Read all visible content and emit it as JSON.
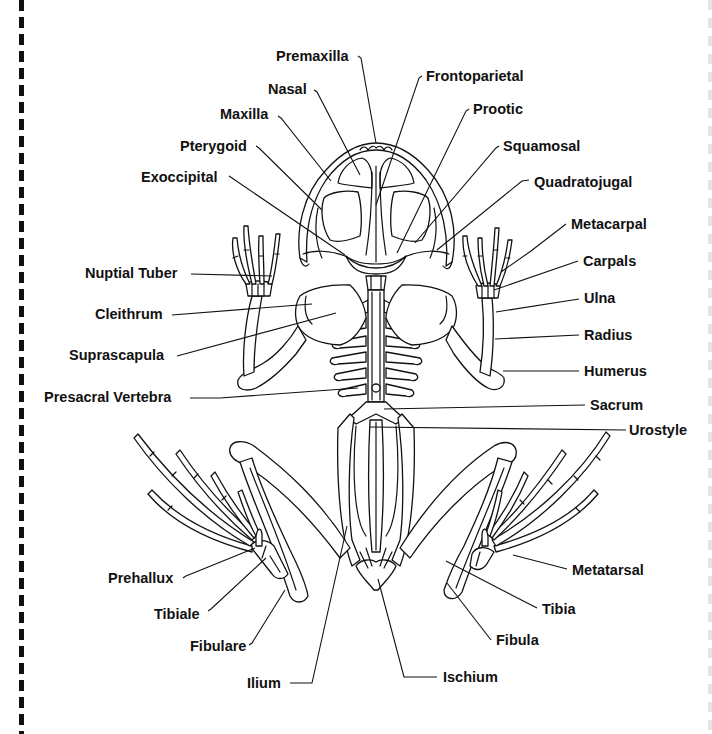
{
  "diagram": {
    "labels": [
      {
        "id": "premaxilla",
        "text": "Premaxilla",
        "x": 276,
        "y": 61,
        "anchor": "start",
        "line": [
          [
            358,
            56
          ],
          [
            361,
            58
          ],
          [
            376,
            143
          ]
        ]
      },
      {
        "id": "nasal",
        "text": "Nasal",
        "x": 268,
        "y": 94,
        "anchor": "start",
        "line": [
          [
            314,
            90
          ],
          [
            317,
            92
          ],
          [
            360,
            175
          ]
        ]
      },
      {
        "id": "maxilla",
        "text": "Maxilla",
        "x": 220,
        "y": 119,
        "anchor": "start",
        "line": [
          [
            278,
            116
          ],
          [
            281,
            118
          ],
          [
            331,
            181
          ]
        ]
      },
      {
        "id": "pterygoid",
        "text": "Pterygoid",
        "x": 180,
        "y": 151,
        "anchor": "start",
        "line": [
          [
            256,
            146
          ],
          [
            259,
            148
          ],
          [
            322,
            210
          ]
        ]
      },
      {
        "id": "exoccipital",
        "text": "Exoccipital",
        "x": 141,
        "y": 182,
        "anchor": "start",
        "line": [
          [
            229,
            176
          ],
          [
            232,
            178
          ],
          [
            345,
            255
          ]
        ]
      },
      {
        "id": "frontoparietal",
        "text": "Frontoparietal",
        "x": 426,
        "y": 81,
        "anchor": "start",
        "line": [
          [
            422,
            76
          ],
          [
            419,
            78
          ],
          [
            376,
            205
          ]
        ]
      },
      {
        "id": "prootic",
        "text": "Prootic",
        "x": 473,
        "y": 114,
        "anchor": "start",
        "line": [
          [
            469,
            109
          ],
          [
            466,
            111
          ],
          [
            397,
            253
          ]
        ]
      },
      {
        "id": "squamosal",
        "text": "Squamosal",
        "x": 503,
        "y": 151,
        "anchor": "start",
        "line": [
          [
            499,
            146
          ],
          [
            496,
            148
          ],
          [
            415,
            243
          ]
        ]
      },
      {
        "id": "quadratojugal",
        "text": "Quadratojugal",
        "x": 534,
        "y": 187,
        "anchor": "start",
        "line": [
          [
            529,
            180
          ],
          [
            522,
            181
          ],
          [
            437,
            250
          ]
        ]
      },
      {
        "id": "metacarpal",
        "text": "Metacarpal",
        "x": 571,
        "y": 229,
        "anchor": "start",
        "line": [
          [
            566,
            224
          ],
          [
            531,
            251
          ],
          [
            501,
            272
          ]
        ]
      },
      {
        "id": "nuptial-tuber",
        "text": "Nuptial Tuber",
        "x": 85,
        "y": 278,
        "anchor": "start",
        "line": [
          [
            191,
            274
          ],
          [
            272,
            276
          ]
        ]
      },
      {
        "id": "carpals",
        "text": "Carpals",
        "x": 583,
        "y": 266,
        "anchor": "start",
        "line": [
          [
            578,
            261
          ],
          [
            494,
            290
          ]
        ]
      },
      {
        "id": "cleithrum",
        "text": "Cleithrum",
        "x": 95,
        "y": 319,
        "anchor": "start",
        "line": [
          [
            172,
            315
          ],
          [
            312,
            304
          ]
        ]
      },
      {
        "id": "ulna",
        "text": "Ulna",
        "x": 584,
        "y": 303,
        "anchor": "start",
        "line": [
          [
            579,
            299
          ],
          [
            496,
            312
          ]
        ]
      },
      {
        "id": "radius",
        "text": "Radius",
        "x": 584,
        "y": 340,
        "anchor": "start",
        "line": [
          [
            579,
            335
          ],
          [
            495,
            339
          ]
        ]
      },
      {
        "id": "suprascapula",
        "text": "Suprascapula",
        "x": 69,
        "y": 360,
        "anchor": "start",
        "line": [
          [
            177,
            356
          ],
          [
            336,
            313
          ]
        ]
      },
      {
        "id": "humerus",
        "text": "Humerus",
        "x": 584,
        "y": 376,
        "anchor": "start",
        "line": [
          [
            579,
            371
          ],
          [
            503,
            371
          ]
        ]
      },
      {
        "id": "presacral-vertebra",
        "text": "Presacral Vertebra",
        "x": 44,
        "y": 402,
        "anchor": "start",
        "line": [
          [
            190,
            398
          ],
          [
            220,
            398
          ],
          [
            358,
            388
          ]
        ]
      },
      {
        "id": "sacrum",
        "text": "Sacrum",
        "x": 590,
        "y": 410,
        "anchor": "start",
        "line": [
          [
            585,
            405
          ],
          [
            384,
            409
          ]
        ]
      },
      {
        "id": "urostyle",
        "text": "Urostyle",
        "x": 629,
        "y": 435,
        "anchor": "start",
        "line": [
          [
            626,
            430
          ],
          [
            370,
            427
          ]
        ]
      },
      {
        "id": "metatarsal",
        "text": "Metatarsal",
        "x": 572,
        "y": 575,
        "anchor": "start",
        "line": [
          [
            567,
            569
          ],
          [
            513,
            555
          ]
        ]
      },
      {
        "id": "prehallux",
        "text": "Prehallux",
        "x": 108,
        "y": 583,
        "anchor": "start",
        "line": [
          [
            183,
            578
          ],
          [
            186,
            576
          ],
          [
            255,
            548
          ]
        ]
      },
      {
        "id": "tibia",
        "text": "Tibia",
        "x": 542,
        "y": 614,
        "anchor": "start",
        "line": [
          [
            537,
            608
          ],
          [
            446,
            561
          ]
        ]
      },
      {
        "id": "tibiale",
        "text": "Tibiale",
        "x": 154,
        "y": 619,
        "anchor": "start",
        "line": [
          [
            208,
            611
          ],
          [
            211,
            609
          ],
          [
            266,
            558
          ]
        ]
      },
      {
        "id": "fibula",
        "text": "Fibula",
        "x": 496,
        "y": 645,
        "anchor": "start",
        "line": [
          [
            491,
            640
          ],
          [
            447,
            583
          ]
        ]
      },
      {
        "id": "fibulare",
        "text": "Fibulare",
        "x": 190,
        "y": 651,
        "anchor": "start",
        "line": [
          [
            249,
            645
          ],
          [
            252,
            643
          ],
          [
            285,
            590
          ]
        ]
      },
      {
        "id": "ischium",
        "text": "Ischium",
        "x": 443,
        "y": 682,
        "anchor": "start",
        "line": [
          [
            437,
            677
          ],
          [
            404,
            677
          ],
          [
            378,
            579
          ]
        ]
      },
      {
        "id": "ilium",
        "text": "Ilium",
        "x": 247,
        "y": 688,
        "anchor": "start",
        "line": [
          [
            290,
            683
          ],
          [
            312,
            683
          ],
          [
            347,
            526
          ]
        ]
      }
    ]
  }
}
